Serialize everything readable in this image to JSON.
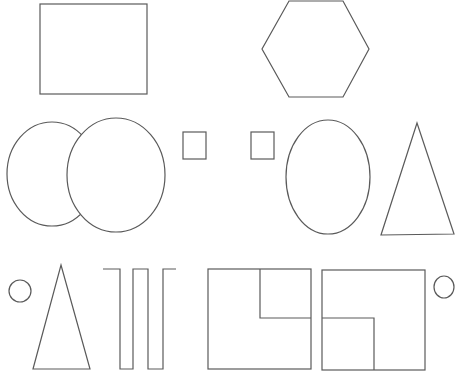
{
  "canvas": {
    "width": 462,
    "height": 381,
    "background": "#ffffff",
    "stroke_color": "#5a5a5a"
  },
  "shapes": [
    {
      "id": "large-square",
      "type": "rect",
      "x": 40,
      "y": 4,
      "width": 107,
      "height": 90
    },
    {
      "id": "hexagon",
      "type": "polygon",
      "points": "289,1 343,1 369,49 343,97 289,97 262,49"
    },
    {
      "id": "left-ellipse",
      "type": "ellipse",
      "cx": 52,
      "cy": 174,
      "rx": 45,
      "ry": 52
    },
    {
      "id": "overlapping-ellipse",
      "type": "ellipse",
      "cx": 116,
      "cy": 175,
      "rx": 49,
      "ry": 57
    },
    {
      "id": "small-square-1",
      "type": "rect",
      "x": 183,
      "y": 132,
      "width": 23,
      "height": 27
    },
    {
      "id": "small-square-2",
      "type": "rect",
      "x": 251,
      "y": 132,
      "width": 23,
      "height": 27
    },
    {
      "id": "tall-ellipse",
      "type": "ellipse",
      "cx": 328,
      "cy": 177,
      "rx": 42,
      "ry": 57
    },
    {
      "id": "large-triangle",
      "type": "polygon",
      "points": "417,123 454,234 381,235"
    },
    {
      "id": "small-circle-left",
      "type": "ellipse",
      "cx": 20,
      "cy": 291,
      "rx": 11,
      "ry": 11
    },
    {
      "id": "narrow-triangle",
      "type": "polygon",
      "points": "61,265 90,369 33,369"
    },
    {
      "id": "square-wave-line",
      "type": "polyline",
      "points": "103,269 120,269 120,369 133,369 133,269 148,269 148,369 163,369 163,269 176,269"
    },
    {
      "id": "box-top-right-cut",
      "type": "rect",
      "x": 208,
      "y": 269,
      "width": 103,
      "height": 100
    },
    {
      "id": "box-top-right-cut-inner",
      "type": "polyline",
      "points": "260,269 260,318 311,318"
    },
    {
      "id": "box-bottom-left-cut",
      "type": "rect",
      "x": 322,
      "y": 270,
      "width": 103,
      "height": 100
    },
    {
      "id": "box-bottom-left-cut-inner",
      "type": "polyline",
      "points": "322,318 374,318 374,370"
    },
    {
      "id": "small-circle-right",
      "type": "ellipse",
      "cx": 444,
      "cy": 287,
      "rx": 10,
      "ry": 11
    }
  ]
}
